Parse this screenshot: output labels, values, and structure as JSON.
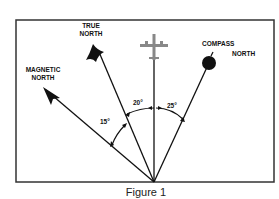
{
  "figure": {
    "caption": "Figure 1",
    "labels": {
      "true_north_line1": "TRUE",
      "true_north_line2": "NORTH",
      "magnetic_north_line1": "MAGNETIC",
      "magnetic_north_line2": "NORTH",
      "compass_north_line1": "COMPASS",
      "compass_north_line2": "NORTH"
    },
    "angles": {
      "variation": "15°",
      "between_true_and_heading": "20°",
      "deviation": "25°"
    },
    "icons": [
      "true-north-star-icon",
      "magnetic-north-arrowhead-icon",
      "compass-north-ball-icon",
      "airplane-icon"
    ]
  }
}
